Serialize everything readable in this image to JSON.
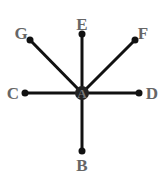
{
  "diagram": {
    "type": "star-graph",
    "center": {
      "id": "A",
      "label": "A",
      "x": 82,
      "y": 93
    },
    "nodes": [
      {
        "id": "E",
        "label": "E",
        "x": 82,
        "y": 34,
        "lx": 82,
        "ly": 30
      },
      {
        "id": "F",
        "label": "F",
        "x": 135,
        "y": 40,
        "lx": 143,
        "ly": 39
      },
      {
        "id": "D",
        "label": "D",
        "x": 139,
        "y": 93,
        "lx": 152,
        "ly": 99
      },
      {
        "id": "B",
        "label": "B",
        "x": 82,
        "y": 151,
        "lx": 82,
        "ly": 171
      },
      {
        "id": "C",
        "label": "C",
        "x": 25,
        "y": 93,
        "lx": 13,
        "ly": 99
      },
      {
        "id": "G",
        "label": "G",
        "x": 30,
        "y": 40,
        "lx": 21,
        "ly": 39
      }
    ],
    "edges": [
      [
        "A",
        "E"
      ],
      [
        "A",
        "F"
      ],
      [
        "A",
        "D"
      ],
      [
        "A",
        "B"
      ],
      [
        "A",
        "C"
      ],
      [
        "A",
        "G"
      ]
    ],
    "colors": {
      "edge": "#111111",
      "node": "#111111",
      "label": "#666666",
      "center_fill": "#888888"
    }
  }
}
